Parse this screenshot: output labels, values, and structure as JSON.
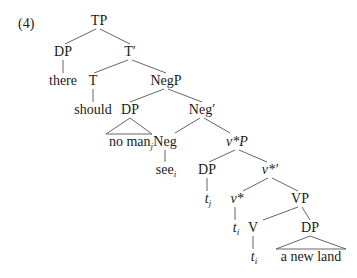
{
  "example_number": "(4)",
  "tree": {
    "nodes": {
      "tp": "TP",
      "dp1": "DP",
      "tbar": "T′",
      "there": "there",
      "t": "T",
      "negp": "NegP",
      "should": "should",
      "dp2": "DP",
      "negbar": "Neg′",
      "noman": "no man",
      "noman_sub": "j",
      "neg": "Neg",
      "vstarp": "v*P",
      "see": "see",
      "see_sub": "i",
      "dp3": "DP",
      "vstarbar": "v*′",
      "tj": "t",
      "tj_sub": "j",
      "vstar": "v*",
      "vp": "VP",
      "ti1": "t",
      "ti1_sub": "i",
      "v": "V",
      "dp4": "DP",
      "ti2": "t",
      "ti2_sub": "i",
      "anewland": "a new land"
    }
  }
}
